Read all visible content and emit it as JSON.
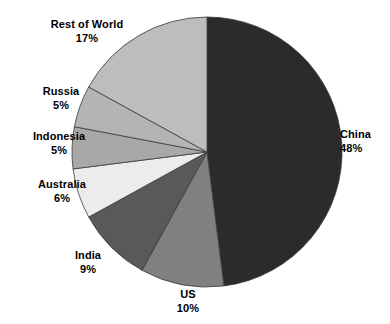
{
  "chart_data": {
    "type": "pie",
    "title": "",
    "subtitle": "",
    "xlabel": "",
    "ylabel": "",
    "legend_position": "none",
    "grid": false,
    "unit": "%",
    "start_angle_deg": 0,
    "direction": "clockwise",
    "categories": [
      "China",
      "US",
      "India",
      "Australia",
      "Indonesia",
      "Russia",
      "Rest of World"
    ],
    "values": [
      48,
      10,
      9,
      6,
      5,
      5,
      17
    ],
    "total": 100,
    "slices": [
      {
        "label": "China",
        "value": 48,
        "value_text": "48%",
        "color": "#2b2b2b"
      },
      {
        "label": "US",
        "value": 10,
        "value_text": "10%",
        "color": "#808080"
      },
      {
        "label": "India",
        "value": 9,
        "value_text": "9%",
        "color": "#595959"
      },
      {
        "label": "Australia",
        "value": 6,
        "value_text": "6%",
        "color": "#ececec"
      },
      {
        "label": "Indonesia",
        "value": 5,
        "value_text": "5%",
        "color": "#a8a8a8"
      },
      {
        "label": "Russia",
        "value": 5,
        "value_text": "5%",
        "color": "#b4b4b4"
      },
      {
        "label": "Rest of World",
        "value": 17,
        "value_text": "17%",
        "color": "#bdbdbd"
      }
    ]
  },
  "colors": {
    "background": "#ffffff",
    "text": "#000000",
    "slice_outline": "#3a3a3a",
    "china": "#2b2b2b",
    "us": "#808080",
    "india": "#595959",
    "australia": "#ececec",
    "indonesia": "#a8a8a8",
    "russia": "#b4b4b4",
    "rest_of_world": "#bdbdbd"
  },
  "labels": {
    "china": {
      "name": "China",
      "pct": "48%"
    },
    "us": {
      "name": "US",
      "pct": "10%"
    },
    "india": {
      "name": "India",
      "pct": "9%"
    },
    "australia": {
      "name": "Australia",
      "pct": "6%"
    },
    "indonesia": {
      "name": "Indonesia",
      "pct": "5%"
    },
    "russia": {
      "name": "Russia",
      "pct": "5%"
    },
    "rest_of_world": {
      "name": "Rest of World",
      "pct": "17%"
    }
  }
}
